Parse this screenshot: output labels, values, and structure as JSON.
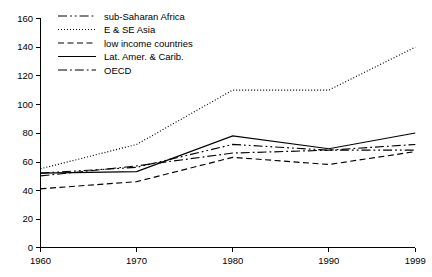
{
  "chart_data": {
    "type": "line",
    "title": "",
    "subtitle": "",
    "xlabel": "",
    "ylabel": "",
    "x": [
      1960,
      1970,
      1980,
      1990,
      1999
    ],
    "xtick_labels": [
      "1960",
      "1970",
      "1980",
      "1990",
      "1999"
    ],
    "ytick_labels": [
      "0",
      "20",
      "40",
      "60",
      "80",
      "100",
      "120",
      "140",
      "160"
    ],
    "yticks": [
      0,
      20,
      40,
      60,
      80,
      100,
      120,
      140,
      160
    ],
    "xlim": [
      1960,
      1999
    ],
    "ylim": [
      0,
      160
    ],
    "grid": false,
    "legend_position": "top-left",
    "series": [
      {
        "name": "sub-Saharan Africa",
        "dash": "dash-dot-dot",
        "color": "#000000",
        "values": [
          52,
          56,
          72,
          68,
          68
        ]
      },
      {
        "name": "E & SE Asia",
        "dash": "dotted",
        "color": "#000000",
        "values": [
          55,
          72,
          110,
          110,
          140
        ]
      },
      {
        "name": "low income countries",
        "dash": "dashed",
        "color": "#000000",
        "values": [
          41,
          46,
          63,
          58,
          67
        ]
      },
      {
        "name": "Lat. Amer. & Carib.",
        "dash": "solid",
        "color": "#000000",
        "values": [
          52,
          53,
          78,
          69,
          80
        ]
      },
      {
        "name": "OECD",
        "dash": "dash-dot",
        "color": "#000000",
        "values": [
          50,
          57,
          66,
          68,
          72
        ]
      }
    ]
  },
  "axes": {
    "y_tick_labels": [
      "160",
      "140",
      "120",
      "100",
      "80",
      "60",
      "40",
      "20",
      "0"
    ],
    "x_tick_labels": [
      "1960",
      "1970",
      "1980",
      "1990",
      "1999"
    ]
  },
  "legend": {
    "entries": [
      {
        "label": "sub-Saharan Africa"
      },
      {
        "label": "E & SE Asia"
      },
      {
        "label": "low income countries"
      },
      {
        "label": "Lat. Amer. & Carib."
      },
      {
        "label": "OECD"
      }
    ]
  }
}
